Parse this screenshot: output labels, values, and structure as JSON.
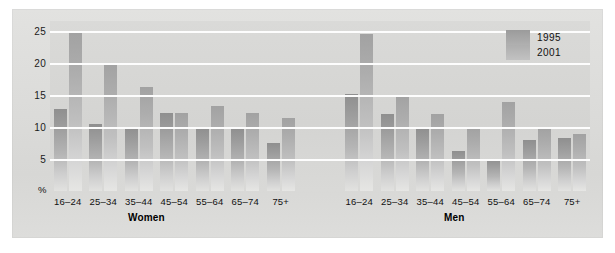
{
  "chart_data": {
    "type": "bar",
    "title": "",
    "xlabel": "",
    "ylabel": "%",
    "ylim": [
      0,
      26.5
    ],
    "yticks": [
      5,
      10,
      15,
      20,
      25
    ],
    "ytick_labels": [
      "5",
      "10",
      "15",
      "20",
      "25"
    ],
    "grid": true,
    "legend_position": "top-right",
    "categories": [
      "16–24",
      "25–34",
      "35–44",
      "45–54",
      "55–64",
      "65–74",
      "75+"
    ],
    "panels": [
      {
        "name": "Women",
        "categories": [
          "16–24",
          "25–34",
          "35–44",
          "45–54",
          "55–64",
          "65–74",
          "75+"
        ],
        "series": [
          {
            "name": "1995",
            "values": [
              12.8,
              10.5,
              10.0,
              12.2,
              9.8,
              9.8,
              7.5
            ]
          },
          {
            "name": "2001",
            "values": [
              24.8,
              20.0,
              16.2,
              12.2,
              13.3,
              12.2,
              11.4
            ]
          }
        ]
      },
      {
        "name": "Men",
        "categories": [
          "16–24",
          "25–34",
          "35–44",
          "45–54",
          "55–64",
          "65–74",
          "75+"
        ],
        "series": [
          {
            "name": "1995",
            "values": [
              15.2,
              12.0,
              9.8,
              6.3,
              5.0,
              8.0,
              8.2
            ]
          },
          {
            "name": "2001",
            "values": [
              24.4,
              15.0,
              12.0,
              9.8,
              13.8,
              9.8,
              8.9
            ]
          }
        ]
      }
    ]
  },
  "axis": {
    "percent_symbol": "%",
    "ticks": [
      "25",
      "20",
      "15",
      "10",
      "5"
    ]
  },
  "legend": {
    "entries": [
      {
        "label": "1995",
        "color": "#9b9b9b"
      },
      {
        "label": "2001",
        "color": "#aeaeae"
      }
    ]
  },
  "captions": {
    "women": "Women",
    "men": "Men"
  },
  "xlabels": {
    "women": [
      "16–24",
      "25–34",
      "35–44",
      "45–54",
      "55–64",
      "65–74",
      "75+"
    ],
    "men": [
      "16–24",
      "25–34",
      "35–44",
      "45–54",
      "55–64",
      "65–74",
      "75+"
    ]
  },
  "colors": {
    "plate_bg": "#dcdcda",
    "plot_bg": "#d6d6d4",
    "gridline": "#fdfdfd",
    "bar_1995": "#9b9b9b",
    "bar_2001": "#b2b2b2",
    "text": "#111111"
  }
}
